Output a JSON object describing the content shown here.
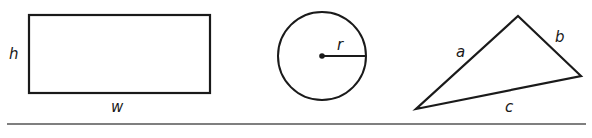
{
  "shapes": {
    "rectangle": {
      "height_label": "h",
      "width_label": "w"
    },
    "circle": {
      "radius_label": "r"
    },
    "triangle": {
      "side_a_label": "a",
      "side_b_label": "b",
      "side_c_label": "c"
    }
  },
  "colors": {
    "stroke": "#1a1a1a",
    "baseline": "#555555",
    "background": "#ffffff"
  }
}
